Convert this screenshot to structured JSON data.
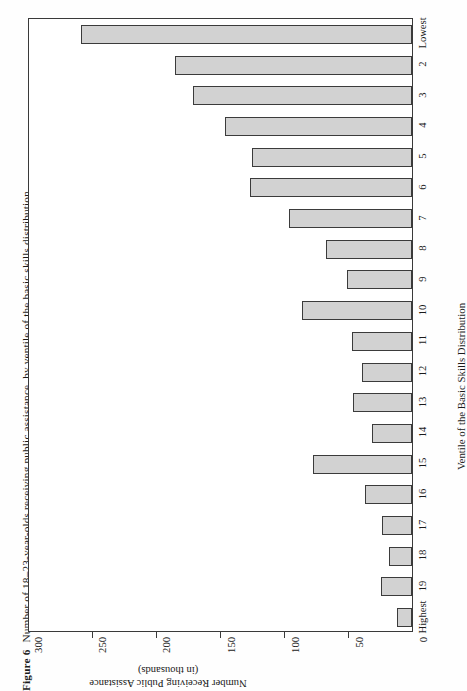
{
  "figure": {
    "number_label": "Figure 6",
    "caption": "Number of 18–23-year-olds receiving public assistance, by ventile of the basic skills distribution"
  },
  "axes": {
    "value_axis_title_line1": "Number Receiving Public Assistance",
    "value_axis_title_line2": "(in thousands)",
    "category_axis_title": "Ventile of the Basic Skills Distribution",
    "value_ticks": [
      "300",
      "250",
      "200",
      "150",
      "100",
      "50",
      "0"
    ],
    "value_min": 0,
    "value_max": 300
  },
  "chart_data": {
    "type": "bar",
    "orientation": "horizontal",
    "title": "Number of 18–23-year-olds receiving public assistance, by ventile of the basic skills distribution",
    "xlabel": "Ventile of the Basic Skills Distribution",
    "ylabel": "Number Receiving Public Assistance (in thousands)",
    "ylim": [
      0,
      300
    ],
    "yticks": [
      0,
      50,
      100,
      150,
      200,
      250,
      300
    ],
    "grid": false,
    "legend": "none",
    "categories": [
      "Lowest",
      "2",
      "3",
      "4",
      "5",
      "6",
      "7",
      "8",
      "9",
      "10",
      "11",
      "12",
      "13",
      "14",
      "15",
      "16",
      "17",
      "18",
      "19",
      "Highest"
    ],
    "values": [
      258,
      185,
      171,
      146,
      125,
      126,
      96,
      67,
      51,
      86,
      47,
      39,
      46,
      31,
      77,
      37,
      23,
      18,
      24,
      12
    ],
    "units": "thousands"
  },
  "style": {
    "bar_fill": "#d2d2d2",
    "bar_stroke": "#3b3b3b",
    "frame_color": "#3a3a3a",
    "text_color": "#1a1a1a",
    "background": "#fefefe"
  }
}
